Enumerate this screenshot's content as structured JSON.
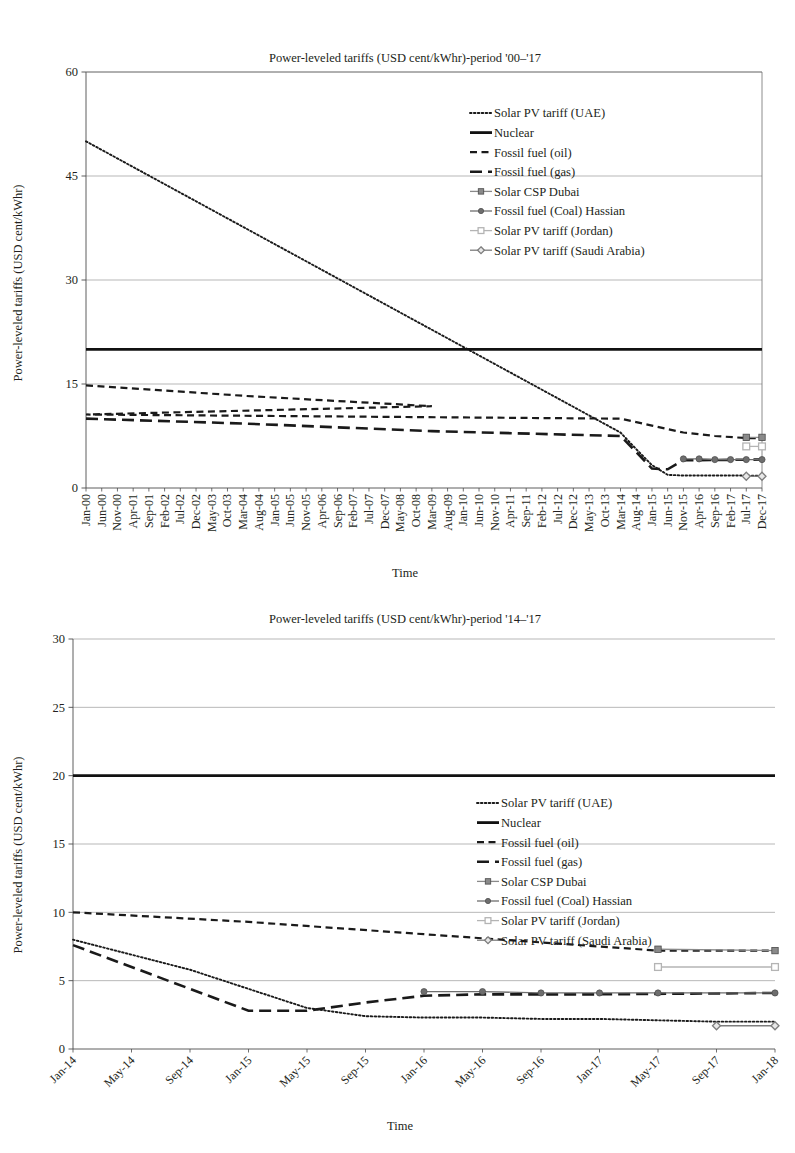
{
  "charts": [
    {
      "id": "chart-top",
      "type": "line",
      "title": "Power-leveled tariffs (USD cent/kWhr)-period '00–'17",
      "xlabel": "Time",
      "ylabel": "Power-leveled tariffs (USD cent/kWhr)",
      "ylim": [
        0,
        60
      ],
      "yticks": [
        0,
        15,
        30,
        45,
        60
      ],
      "grid": true,
      "legend_position": "top-right-inside",
      "categories": [
        "Jan-00",
        "Jun-00",
        "Nov-00",
        "Apr-01",
        "Sep-01",
        "Feb-02",
        "Jul-02",
        "Dec-02",
        "May-03",
        "Oct-03",
        "Mar-04",
        "Aug-04",
        "Jan-05",
        "Jun-05",
        "Nov-05",
        "Apr-06",
        "Sep-06",
        "Feb-07",
        "Jul-07",
        "Dec-07",
        "May-08",
        "Oct-08",
        "Mar-09",
        "Aug-09",
        "Jan-10",
        "Jun-10",
        "Nov-10",
        "Apr-11",
        "Sep-11",
        "Feb-12",
        "Jul-12",
        "Dec-12",
        "May-13",
        "Oct-13",
        "Mar-14",
        "Aug-14",
        "Jan-15",
        "Jun-15",
        "Nov-15",
        "Apr-16",
        "Sep-16",
        "Feb-17",
        "Jul-17",
        "Dec-17"
      ],
      "series": [
        {
          "name": "Solar PV tariff (UAE)",
          "style": "dotted",
          "marker": "none",
          "color": "#1a1a1a",
          "x": [
            "Jan-00",
            "Mar-14",
            "Aug-14",
            "Jan-15",
            "Jun-15",
            "Nov-15",
            "Apr-16",
            "Sep-16",
            "Feb-17",
            "Jul-17",
            "Dec-17"
          ],
          "values": [
            50.0,
            8.0,
            5.6,
            3.3,
            1.9,
            1.8,
            1.8,
            1.8,
            1.8,
            1.8,
            1.75
          ]
        },
        {
          "name": "Nuclear",
          "style": "solid",
          "marker": "none",
          "color": "#111111",
          "x": [
            "Jan-00",
            "Dec-17"
          ],
          "values": [
            20.0,
            20.0
          ]
        },
        {
          "name": "Fossil fuel (oil)",
          "style": "dashed",
          "marker": "none",
          "color": "#1a1a1a",
          "x": [
            "Jan-00",
            "Mar-04",
            "Mar-09",
            "Mar-13",
            "Mar-14",
            "Jan-15",
            "Nov-15",
            "Sep-16",
            "Jul-17",
            "Dec-17"
          ],
          "values": [
            14.8,
            13.3,
            11.8,
            10.6,
            10.0,
            9.0,
            8.0,
            7.5,
            7.2,
            7.2
          ]
        },
        {
          "name": "Fossil fuel (gas)",
          "style": "long-dash",
          "marker": "none",
          "color": "#1a1a1a",
          "x": [
            "Jan-00",
            "Mar-04",
            "Mar-09",
            "Mar-14",
            "Aug-14",
            "Jan-15",
            "Jun-15",
            "Nov-15",
            "Dec-17"
          ],
          "values": [
            10.0,
            9.3,
            8.2,
            7.5,
            5.2,
            2.8,
            2.7,
            4.0,
            4.1
          ]
        },
        {
          "name": "Solar CSP Dubai",
          "style": "solid-marker",
          "marker": "square",
          "color": "#8a8a8a",
          "x": [
            "Jul-17",
            "Dec-17"
          ],
          "values": [
            7.3,
            7.3
          ]
        },
        {
          "name": "Fossil fuel (Coal) Hassian",
          "style": "solid-marker",
          "marker": "circle",
          "color": "#6e6e6e",
          "x": [
            "Nov-15",
            "Apr-16",
            "Sep-16",
            "Feb-17",
            "Jul-17",
            "Dec-17"
          ],
          "values": [
            4.2,
            4.2,
            4.1,
            4.1,
            4.1,
            4.1
          ]
        },
        {
          "name": "Solar PV tariff (Jordan)",
          "style": "solid-marker",
          "marker": "open-square",
          "color": "#b4b4b4",
          "x": [
            "Jul-17",
            "Dec-17"
          ],
          "values": [
            6.0,
            6.0
          ]
        },
        {
          "name": "Solar PV tariff (Saudi Arabia)",
          "style": "solid-marker",
          "marker": "diamond",
          "color": "#7d7d7d",
          "x": [
            "Jul-17",
            "Dec-17"
          ],
          "values": [
            1.7,
            1.7
          ]
        }
      ]
    },
    {
      "id": "chart-bottom",
      "type": "line",
      "title": "Power-leveled tariffs (USD cent/kWhr)-period '14–'17",
      "xlabel": "Time",
      "ylabel": "Power-leveled tariffs (USD cent/kWhr)",
      "ylim": [
        0,
        30
      ],
      "yticks": [
        0,
        5,
        10,
        15,
        20,
        25,
        30
      ],
      "grid": true,
      "legend_position": "middle-right-inside",
      "categories": [
        "Jan-14",
        "May-14",
        "Sep-14",
        "Jan-15",
        "May-15",
        "Sep-15",
        "Jan-16",
        "May-16",
        "Sep-16",
        "Jan-17",
        "May-17",
        "Sep-17",
        "Jan-18"
      ],
      "series": [
        {
          "name": "Solar PV tariff (UAE)",
          "style": "dotted",
          "marker": "none",
          "color": "#1a1a1a",
          "x": [
            "Jan-14",
            "Sep-14",
            "May-15",
            "Sep-15",
            "Jan-16",
            "May-16",
            "Sep-16",
            "Jan-17",
            "May-17",
            "Sep-17",
            "Jan-18"
          ],
          "values": [
            8.0,
            5.8,
            3.0,
            2.4,
            2.3,
            2.3,
            2.2,
            2.2,
            2.1,
            2.0,
            2.0
          ]
        },
        {
          "name": "Nuclear",
          "style": "solid",
          "marker": "none",
          "color": "#111111",
          "x": [
            "Jan-14",
            "Jan-18"
          ],
          "values": [
            20.0,
            20.0
          ]
        },
        {
          "name": "Fossil fuel (oil)",
          "style": "dashed",
          "marker": "none",
          "color": "#1a1a1a",
          "x": [
            "Jan-14",
            "Jan-15",
            "Jan-16",
            "Jan-17",
            "May-17",
            "Jan-18"
          ],
          "values": [
            10.0,
            9.3,
            8.4,
            7.5,
            7.2,
            7.2
          ]
        },
        {
          "name": "Fossil fuel (gas)",
          "style": "long-dash",
          "marker": "none",
          "color": "#1a1a1a",
          "x": [
            "Jan-14",
            "Jan-15",
            "May-15",
            "Sep-15",
            "Jan-16",
            "May-16",
            "Sep-16",
            "Jan-17",
            "Jan-18"
          ],
          "values": [
            7.6,
            2.8,
            2.8,
            3.4,
            3.9,
            4.0,
            4.0,
            4.0,
            4.1
          ]
        },
        {
          "name": "Solar CSP Dubai",
          "style": "solid-marker",
          "marker": "square",
          "color": "#8a8a8a",
          "x": [
            "May-17",
            "Jan-18"
          ],
          "values": [
            7.3,
            7.2
          ]
        },
        {
          "name": "Fossil fuel (Coal) Hassian",
          "style": "solid-marker",
          "marker": "circle",
          "color": "#6e6e6e",
          "x": [
            "Jan-16",
            "May-16",
            "Sep-16",
            "Jan-17",
            "May-17",
            "Jan-18"
          ],
          "values": [
            4.2,
            4.2,
            4.1,
            4.1,
            4.1,
            4.1
          ]
        },
        {
          "name": "Solar PV tariff (Jordan)",
          "style": "solid-marker",
          "marker": "open-square",
          "color": "#b4b4b4",
          "x": [
            "May-17",
            "Jan-18"
          ],
          "values": [
            6.0,
            6.0
          ]
        },
        {
          "name": "Solar PV tariff (Saudi Arabia)",
          "style": "solid-marker",
          "marker": "diamond",
          "color": "#7d7d7d",
          "x": [
            "Sep-17",
            "Jan-18"
          ],
          "values": [
            1.7,
            1.7
          ]
        }
      ]
    }
  ]
}
